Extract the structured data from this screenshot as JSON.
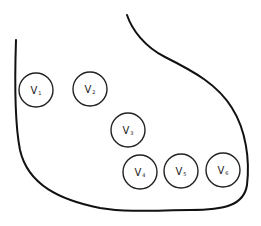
{
  "diagram": {
    "type": "ecg-precordial-lead-placement",
    "outline": {
      "stroke_color": "#111111"
    },
    "leads": [
      {
        "id": "V1",
        "letter": "V",
        "subscript": "1",
        "cx": 36,
        "cy": 90
      },
      {
        "id": "V2",
        "letter": "V",
        "subscript": "2",
        "cx": 90,
        "cy": 89
      },
      {
        "id": "V3",
        "letter": "V",
        "subscript": "3",
        "cx": 128,
        "cy": 130
      },
      {
        "id": "V4",
        "letter": "V",
        "subscript": "4",
        "cx": 140,
        "cy": 172
      },
      {
        "id": "V5",
        "letter": "V",
        "subscript": "5",
        "cx": 181,
        "cy": 171
      },
      {
        "id": "V6",
        "letter": "V",
        "subscript": "6",
        "cx": 223,
        "cy": 170
      }
    ]
  }
}
